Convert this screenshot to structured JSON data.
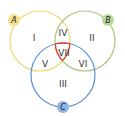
{
  "diagram": {
    "type": "venn-3-set",
    "sets": [
      {
        "id": "A",
        "label": "A",
        "color": "#f2d774",
        "badge_color": "#f7e08a",
        "cx": 40,
        "cy": 41,
        "r": 30,
        "label_x": 14,
        "label_y": 20
      },
      {
        "id": "B",
        "label": "B",
        "color": "#a9c77f",
        "badge_color": "#bcd99a",
        "cx": 85,
        "cy": 41,
        "r": 30,
        "label_x": 108,
        "label_y": 20
      },
      {
        "id": "C",
        "label": "C",
        "color": "#5b8fd0",
        "badge_color": "#8fb6e6",
        "cx": 63,
        "cy": 75,
        "r": 32,
        "label_x": 63,
        "label_y": 107
      }
    ],
    "center_outline_color": "#d9433a",
    "regions": [
      {
        "id": "I",
        "label": "I",
        "x": 34,
        "y": 38
      },
      {
        "id": "II",
        "label": "II",
        "x": 92,
        "y": 38
      },
      {
        "id": "III",
        "label": "III",
        "x": 63,
        "y": 84
      },
      {
        "id": "IV",
        "label": "IV",
        "x": 63,
        "y": 33
      },
      {
        "id": "V",
        "label": "V",
        "x": 45,
        "y": 64
      },
      {
        "id": "VI",
        "label": "VI",
        "x": 83,
        "y": 64
      },
      {
        "id": "VII",
        "label": "VII",
        "x": 64,
        "y": 53
      }
    ]
  }
}
